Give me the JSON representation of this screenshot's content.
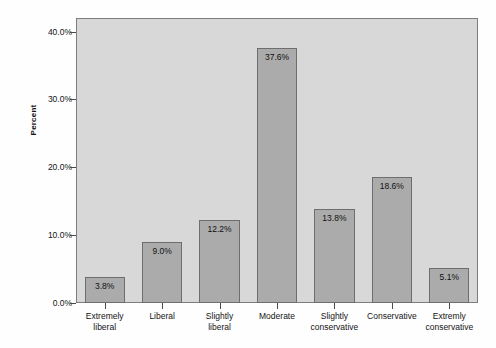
{
  "chart_data": {
    "type": "bar",
    "title": "",
    "xlabel": "",
    "ylabel": "Percent",
    "categories": [
      "Extremely\nliberal",
      "Liberal",
      "Slightly\nliberal",
      "Moderate",
      "Slightly\nconservative",
      "Conservative",
      "Extremly\nconservative"
    ],
    "values": [
      3.8,
      9.0,
      12.2,
      37.6,
      13.8,
      18.6,
      5.1
    ],
    "value_labels": [
      "3.8%",
      "9.0%",
      "12.2%",
      "37.6%",
      "13.8%",
      "18.6%",
      "5.1%"
    ],
    "ylim": [
      0,
      42
    ],
    "yticks": [
      0,
      10,
      20,
      30,
      40
    ],
    "ytick_labels": [
      "0.0%",
      "10.0%",
      "20.0%",
      "30.0%",
      "40.0%"
    ],
    "grid": false,
    "legend": null,
    "colors": {
      "bar_fill": "#ababab",
      "bar_border": "#6e6e6e",
      "plot_background": "#d8d8d8",
      "frame": "#7d7d7d",
      "text": "#141414",
      "page_background": "#fefefe"
    }
  }
}
